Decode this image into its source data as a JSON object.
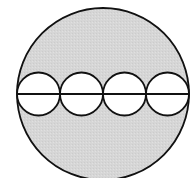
{
  "diagram": {
    "colors": {
      "background": "#ffffff",
      "shaded_fill": "#d6d6d6",
      "inner_fill": "#ffffff",
      "stroke": "#111111"
    },
    "outer_circle": {
      "cx": 103,
      "cy": 94,
      "r": 86
    },
    "diameter_line": {
      "x1": 17,
      "y1": 94,
      "x2": 189,
      "y2": 94
    },
    "inner_circles": [
      {
        "cx": 38.5,
        "cy": 94,
        "r": 21.5
      },
      {
        "cx": 81.5,
        "cy": 94,
        "r": 21.5
      },
      {
        "cx": 124.5,
        "cy": 94,
        "r": 21.5
      },
      {
        "cx": 167.5,
        "cy": 94,
        "r": 21.5
      }
    ]
  }
}
